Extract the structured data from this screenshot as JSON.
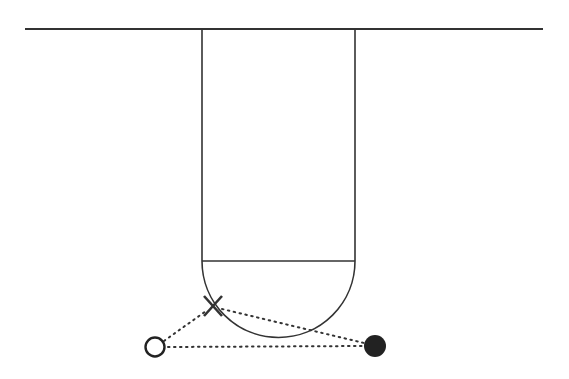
{
  "diagram": {
    "type": "basketball-play-diagram",
    "colors": {
      "background": "#ffffff",
      "court_lines": "#333333",
      "dotted_lines": "#333333",
      "ball": "#222222"
    },
    "elements": {
      "baseline": {
        "x1": 25,
        "y1": 29,
        "x2": 543,
        "y2": 29
      },
      "lane": {
        "left_x": 202,
        "right_x": 355,
        "top_y": 29,
        "free_throw_y": 261
      },
      "free_throw_semicircle": {
        "cx": 278.5,
        "cy": 261,
        "r": 76.5
      },
      "defender_x": {
        "cx": 213,
        "cy": 306,
        "label": "X"
      },
      "offensive_player": {
        "cx": 155,
        "cy": 347,
        "r": 10,
        "symbol": "open-circle"
      },
      "ball": {
        "cx": 375,
        "cy": 346,
        "r": 11,
        "symbol": "filled-circle"
      },
      "dotted_lines": [
        {
          "from": "offensive_player",
          "to": "defender_x"
        },
        {
          "from": "defender_x",
          "to": "ball"
        },
        {
          "from": "offensive_player",
          "to": "ball"
        }
      ]
    }
  }
}
